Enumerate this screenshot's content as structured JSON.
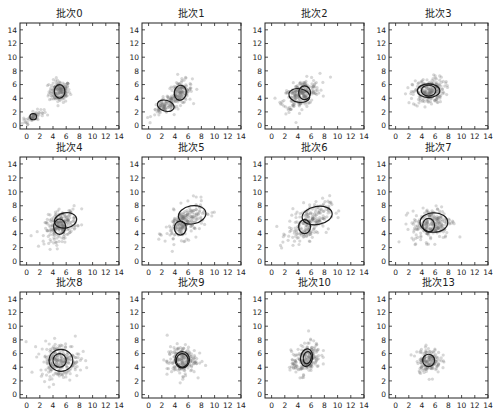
{
  "figure": {
    "rows": 3,
    "cols": 4,
    "xlim": [
      -1,
      14
    ],
    "ylim": [
      -0.5,
      15
    ],
    "xticks": [
      0,
      2,
      4,
      6,
      8,
      10,
      12,
      14
    ],
    "yticks": [
      0,
      2,
      4,
      6,
      8,
      10,
      12,
      14
    ],
    "colors": {
      "point": "#6e6e6e",
      "ellipse": "#1a1a1a",
      "axes": "#222222",
      "background": "#ffffff"
    }
  },
  "chart_data": {
    "type": "scatter",
    "title": "",
    "xlabel": "",
    "ylabel": "",
    "xlim": [
      0,
      14
    ],
    "ylim": [
      0,
      14
    ],
    "grid": false,
    "legend": null,
    "panels": [
      {
        "title": "批次0",
        "clusters": [
          {
            "center": [
              5.0,
              5.0
            ],
            "spread": [
              0.8,
              0.8
            ],
            "corr": 0.0,
            "n": 160
          },
          {
            "center": [
              1.0,
              1.3
            ],
            "spread": [
              0.8,
              0.5
            ],
            "corr": 0.7,
            "n": 60
          }
        ],
        "ellipses": [
          {
            "cx": 5.0,
            "cy": 5.0,
            "rx": 0.8,
            "ry": 1.0,
            "angle": 0
          },
          {
            "cx": 1.0,
            "cy": 1.3,
            "rx": 0.5,
            "ry": 0.45,
            "angle": 0
          }
        ]
      },
      {
        "title": "批次1",
        "clusters": [
          {
            "center": [
              4.8,
              4.8
            ],
            "spread": [
              0.9,
              0.9
            ],
            "corr": 0.3,
            "n": 150
          },
          {
            "center": [
              2.5,
              2.8
            ],
            "spread": [
              1.0,
              0.7
            ],
            "corr": 0.6,
            "n": 90
          }
        ],
        "ellipses": [
          {
            "cx": 4.8,
            "cy": 4.8,
            "rx": 0.9,
            "ry": 1.1,
            "angle": 10
          },
          {
            "cx": 2.6,
            "cy": 2.9,
            "rx": 1.3,
            "ry": 0.8,
            "angle": 15
          }
        ]
      },
      {
        "title": "批次2",
        "clusters": [
          {
            "center": [
              4.5,
              4.6
            ],
            "spread": [
              1.4,
              1.1
            ],
            "corr": 0.5,
            "n": 220
          }
        ],
        "ellipses": [
          {
            "cx": 4.2,
            "cy": 4.4,
            "rx": 1.6,
            "ry": 1.0,
            "angle": 10
          },
          {
            "cx": 5.0,
            "cy": 4.8,
            "rx": 0.9,
            "ry": 1.0,
            "angle": 0
          }
        ]
      },
      {
        "title": "批次3",
        "clusters": [
          {
            "center": [
              5.0,
              5.0
            ],
            "spread": [
              1.2,
              1.0
            ],
            "corr": 0.2,
            "n": 220
          }
        ],
        "ellipses": [
          {
            "cx": 5.0,
            "cy": 5.1,
            "rx": 1.7,
            "ry": 1.0,
            "angle": 0
          },
          {
            "cx": 5.0,
            "cy": 5.1,
            "rx": 1.1,
            "ry": 0.8,
            "angle": 0
          }
        ]
      },
      {
        "title": "批次4",
        "clusters": [
          {
            "center": [
              5.2,
              5.2
            ],
            "spread": [
              1.2,
              1.1
            ],
            "corr": 0.4,
            "n": 230
          }
        ],
        "ellipses": [
          {
            "cx": 5.9,
            "cy": 5.9,
            "rx": 1.7,
            "ry": 1.1,
            "angle": -10
          },
          {
            "cx": 5.0,
            "cy": 5.0,
            "rx": 0.9,
            "ry": 1.1,
            "angle": 0
          }
        ]
      },
      {
        "title": "批次5",
        "clusters": [
          {
            "center": [
              5.5,
              5.6
            ],
            "spread": [
              1.5,
              1.3
            ],
            "corr": 0.5,
            "n": 220
          }
        ],
        "ellipses": [
          {
            "cx": 6.6,
            "cy": 6.7,
            "rx": 2.1,
            "ry": 1.3,
            "angle": -10
          },
          {
            "cx": 4.8,
            "cy": 4.8,
            "rx": 0.9,
            "ry": 1.0,
            "angle": 0
          }
        ]
      },
      {
        "title": "批次6",
        "clusters": [
          {
            "center": [
              5.6,
              5.6
            ],
            "spread": [
              1.6,
              1.4
            ],
            "corr": 0.5,
            "n": 220
          }
        ],
        "ellipses": [
          {
            "cx": 6.9,
            "cy": 6.6,
            "rx": 2.3,
            "ry": 1.3,
            "angle": -10
          },
          {
            "cx": 5.0,
            "cy": 5.0,
            "rx": 0.9,
            "ry": 1.0,
            "angle": 0
          }
        ]
      },
      {
        "title": "批次7",
        "clusters": [
          {
            "center": [
              5.5,
              5.4
            ],
            "spread": [
              1.5,
              1.2
            ],
            "corr": 0.2,
            "n": 230
          }
        ],
        "ellipses": [
          {
            "cx": 5.8,
            "cy": 5.6,
            "rx": 2.1,
            "ry": 1.4,
            "angle": 0
          },
          {
            "cx": 5.0,
            "cy": 5.2,
            "rx": 0.9,
            "ry": 1.0,
            "angle": 0
          }
        ]
      },
      {
        "title": "批次8",
        "clusters": [
          {
            "center": [
              5.0,
              5.0
            ],
            "spread": [
              1.5,
              1.3
            ],
            "corr": 0.0,
            "n": 230
          }
        ],
        "ellipses": [
          {
            "cx": 5.2,
            "cy": 5.0,
            "rx": 1.8,
            "ry": 1.6,
            "angle": 0
          },
          {
            "cx": 5.0,
            "cy": 5.0,
            "rx": 1.0,
            "ry": 1.0,
            "angle": 0
          }
        ]
      },
      {
        "title": "批次9",
        "clusters": [
          {
            "center": [
              5.0,
              5.0
            ],
            "spread": [
              1.1,
              1.1
            ],
            "corr": 0.1,
            "n": 200
          }
        ],
        "ellipses": [
          {
            "cx": 5.1,
            "cy": 5.1,
            "rx": 1.1,
            "ry": 1.2,
            "angle": 0
          },
          {
            "cx": 5.1,
            "cy": 5.0,
            "rx": 0.9,
            "ry": 1.0,
            "angle": 0
          }
        ]
      },
      {
        "title": "批次10",
        "clusters": [
          {
            "center": [
              5.2,
              5.2
            ],
            "spread": [
              1.1,
              1.2
            ],
            "corr": 0.4,
            "n": 200
          }
        ],
        "ellipses": [
          {
            "cx": 5.3,
            "cy": 5.4,
            "rx": 0.9,
            "ry": 1.3,
            "angle": 10
          },
          {
            "cx": 5.4,
            "cy": 5.4,
            "rx": 0.6,
            "ry": 0.9,
            "angle": 10
          }
        ]
      },
      {
        "title": "批次13",
        "clusters": [
          {
            "center": [
              5.0,
              5.0
            ],
            "spread": [
              0.9,
              0.9
            ],
            "corr": 0.0,
            "n": 160
          }
        ],
        "ellipses": [
          {
            "cx": 5.0,
            "cy": 5.0,
            "rx": 0.9,
            "ry": 0.9,
            "angle": 0
          }
        ]
      }
    ]
  }
}
